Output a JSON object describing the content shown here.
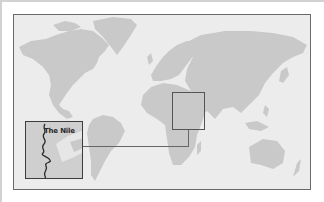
{
  "map": {
    "type": "world-map",
    "colors": {
      "ocean": "#ececec",
      "land": "#c9c9c9",
      "frame": "#6a6a6a",
      "river": "#2a2a2a"
    },
    "highlight_region": "Northeast Africa / Arabian Peninsula"
  },
  "inset": {
    "label": "The Nile",
    "feature": "river"
  }
}
